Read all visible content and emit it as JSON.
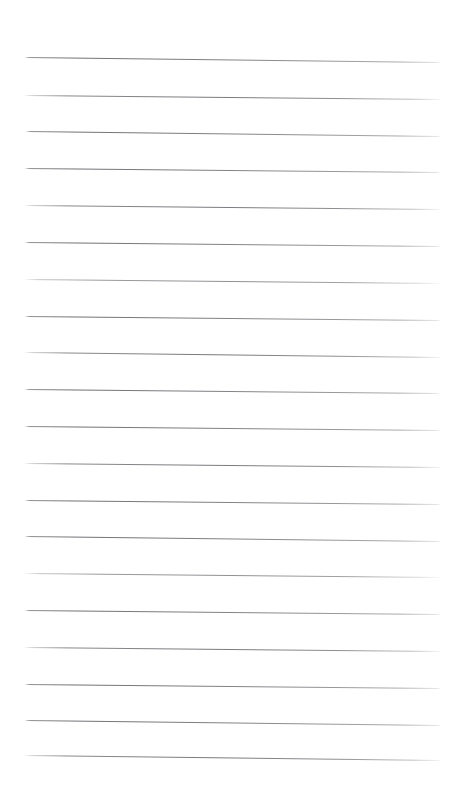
{
  "document": {
    "kind": "blank-ruled-notepad-page",
    "title": "",
    "body_text": "",
    "page_width": 459,
    "page_height": 812,
    "background_color": "#ffffff",
    "has_handwriting": false,
    "has_printed_text": false,
    "has_margin_rule": false,
    "has_holes": false
  },
  "ruling": {
    "line_color": "#6e6e74",
    "line_count": 20,
    "line_thickness_px": 1.25,
    "first_line_y": 58,
    "last_line_y": 755,
    "line_spacing_px": 36.7,
    "left_x": 25,
    "right_x": 441,
    "slope_drop_px": 4,
    "lines": [
      {
        "index": 1,
        "y_left": 57,
        "y_right": 62,
        "left_x": 25,
        "right_x": 441,
        "style": "normal"
      },
      {
        "index": 2,
        "y_left": 95,
        "y_right": 99,
        "left_x": 25,
        "right_x": 441,
        "style": "soft-head"
      },
      {
        "index": 3,
        "y_left": 131,
        "y_right": 136,
        "left_x": 26,
        "right_x": 441,
        "style": "normal"
      },
      {
        "index": 4,
        "y_left": 168,
        "y_right": 172,
        "left_x": 25,
        "right_x": 441,
        "style": "normal"
      },
      {
        "index": 5,
        "y_left": 205,
        "y_right": 209,
        "left_x": 25,
        "right_x": 440,
        "style": "soft-head"
      },
      {
        "index": 6,
        "y_left": 242,
        "y_right": 246,
        "left_x": 25,
        "right_x": 441,
        "style": "normal"
      },
      {
        "index": 7,
        "y_left": 279,
        "y_right": 283,
        "left_x": 25,
        "right_x": 441,
        "style": "faint"
      },
      {
        "index": 8,
        "y_left": 316,
        "y_right": 320,
        "left_x": 25,
        "right_x": 441,
        "style": "normal"
      },
      {
        "index": 9,
        "y_left": 352,
        "y_right": 357,
        "left_x": 25,
        "right_x": 441,
        "style": "soft-head"
      },
      {
        "index": 10,
        "y_left": 389,
        "y_right": 393,
        "left_x": 25,
        "right_x": 440,
        "style": "normal"
      },
      {
        "index": 11,
        "y_left": 426,
        "y_right": 430,
        "left_x": 25,
        "right_x": 441,
        "style": "normal"
      },
      {
        "index": 12,
        "y_left": 463,
        "y_right": 467,
        "left_x": 25,
        "right_x": 441,
        "style": "soft-head"
      },
      {
        "index": 13,
        "y_left": 500,
        "y_right": 504,
        "left_x": 25,
        "right_x": 441,
        "style": "normal"
      },
      {
        "index": 14,
        "y_left": 536,
        "y_right": 541,
        "left_x": 25,
        "right_x": 441,
        "style": "normal"
      },
      {
        "index": 15,
        "y_left": 573,
        "y_right": 577,
        "left_x": 25,
        "right_x": 441,
        "style": "faint"
      },
      {
        "index": 16,
        "y_left": 610,
        "y_right": 614,
        "left_x": 25,
        "right_x": 441,
        "style": "normal"
      },
      {
        "index": 17,
        "y_left": 647,
        "y_right": 651,
        "left_x": 25,
        "right_x": 441,
        "style": "soft-head"
      },
      {
        "index": 18,
        "y_left": 684,
        "y_right": 688,
        "left_x": 25,
        "right_x": 441,
        "style": "normal"
      },
      {
        "index": 19,
        "y_left": 720,
        "y_right": 725,
        "left_x": 25,
        "right_x": 441,
        "style": "normal"
      },
      {
        "index": 20,
        "y_left": 755,
        "y_right": 760,
        "left_x": 25,
        "right_x": 441,
        "style": "soft-head"
      }
    ]
  },
  "margins": {
    "top_px": 57,
    "bottom_px": 52,
    "left_px": 25,
    "right_px": 18
  }
}
